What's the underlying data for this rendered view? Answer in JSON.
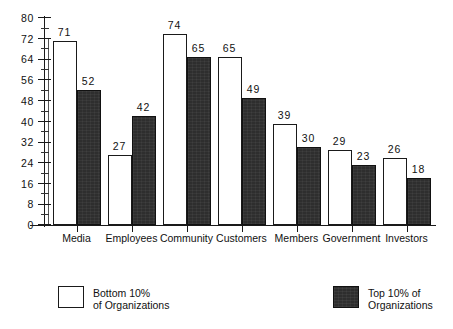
{
  "chart_data": {
    "type": "bar",
    "title": "",
    "subtitle": "",
    "xlabel": "",
    "ylabel": "",
    "ylim": [
      0,
      80
    ],
    "grid": false,
    "legend_position": "bottom",
    "y_ticks": [
      0,
      8,
      16,
      24,
      32,
      40,
      48,
      56,
      64,
      72,
      80
    ],
    "y_tick_labels": [
      "0",
      "8",
      "16",
      "24",
      "32",
      "40",
      "48",
      "56",
      "64",
      "72",
      "80"
    ],
    "y_minor_tick_interval": 4,
    "categories": [
      "Media",
      "Employees",
      "Community",
      "Customers",
      "Members",
      "Government",
      "Investors"
    ],
    "series": [
      {
        "name": "Bottom 10% of Organizations",
        "color": "#ffffff",
        "edge_color": "#1a1a1a",
        "values": [
          71,
          27,
          74,
          65,
          39,
          29,
          26
        ]
      },
      {
        "name": "Top 10% of Organizations",
        "color": "#2e2e2e",
        "edge_color": "#111111",
        "values": [
          52,
          42,
          65,
          49,
          30,
          23,
          18
        ]
      }
    ]
  },
  "legend": {
    "entries": [
      {
        "swatch": "light",
        "line1": "Bottom 10%",
        "line2": "of Organizations"
      },
      {
        "swatch": "dark",
        "line1": "Top 10% of",
        "line2": "Organizations"
      }
    ]
  }
}
